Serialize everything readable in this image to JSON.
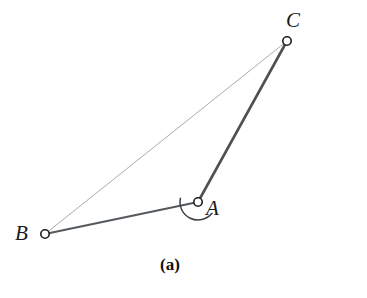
{
  "figure": {
    "caption": "(a)",
    "background_color": "#ffffff"
  },
  "labels": {
    "a": "A",
    "b": "B",
    "c": "C"
  },
  "chart_data": {
    "type": "diagram",
    "title": "(a)",
    "points": [
      {
        "name": "A",
        "x": 198,
        "y": 202,
        "marker": "open-circle",
        "marker_radius": 4.2
      },
      {
        "name": "B",
        "x": 45,
        "y": 234,
        "marker": "open-circle",
        "marker_radius": 4.2
      },
      {
        "name": "C",
        "x": 287,
        "y": 41,
        "marker": "open-circle",
        "marker_radius": 4.2
      }
    ],
    "segments": [
      {
        "name": "AB",
        "from": "A",
        "to": "B",
        "color": "#555a5e",
        "width": 2.2,
        "style": "solid",
        "emphasis": "thick"
      },
      {
        "name": "AC",
        "from": "A",
        "to": "C",
        "color": "#4d5155",
        "width": 2.6,
        "style": "solid",
        "emphasis": "thick"
      },
      {
        "name": "BC",
        "from": "B",
        "to": "C",
        "color": "#a8abaf",
        "width": 1.0,
        "style": "solid",
        "emphasis": "thin"
      }
    ],
    "angle_marks": [
      {
        "name": "angle-at-A",
        "vertex": "A",
        "radius": 18,
        "from_ray": "AB",
        "to_ray": "AC",
        "start_angle_deg": 168,
        "end_angle_deg": 321,
        "sweep": "counterclockwise",
        "color": "#3c4044",
        "width": 1.5
      }
    ],
    "xlabel": "",
    "ylabel": "",
    "grid": false,
    "legend": false
  }
}
